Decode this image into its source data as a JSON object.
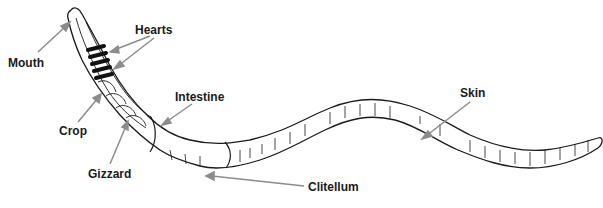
{
  "diagram": {
    "colors": {
      "outline": "#1a1a1a",
      "leader": "#8c8c8c",
      "hearts": "#111111",
      "label": "#1a1a1a",
      "background": "#ffffff"
    },
    "labels": [
      {
        "id": "mouth",
        "text": "Mouth",
        "x": 8,
        "y": 56
      },
      {
        "id": "hearts",
        "text": "Hearts",
        "x": 135,
        "y": 23
      },
      {
        "id": "intestine",
        "text": "Intestine",
        "x": 175,
        "y": 90
      },
      {
        "id": "crop",
        "text": "Crop",
        "x": 59,
        "y": 124
      },
      {
        "id": "gizzard",
        "text": "Gizzard",
        "x": 88,
        "y": 167
      },
      {
        "id": "clitellum",
        "text": "Clitellum",
        "x": 308,
        "y": 180
      },
      {
        "id": "skin",
        "text": "Skin",
        "x": 460,
        "y": 86
      }
    ]
  }
}
